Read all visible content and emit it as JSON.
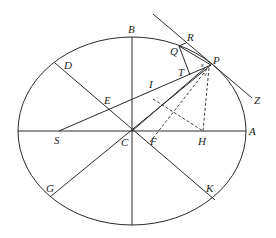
{
  "figure": {
    "type": "geometric-diagram",
    "colors": {
      "background": "#ffffff",
      "stroke": "#2a2a2a",
      "text": "#222222"
    },
    "ellipse": {
      "cx": 132,
      "cy": 131,
      "rx": 114,
      "ry": 94
    },
    "points": {
      "A": {
        "label": "A",
        "x": 246,
        "y": 131
      },
      "B": {
        "label": "B",
        "x": 132,
        "y": 37
      },
      "C": {
        "label": "C",
        "x": 132,
        "y": 131
      },
      "D": {
        "label": "D",
        "x": 55,
        "y": 63
      },
      "E": {
        "label": "E",
        "x": 108,
        "y": 108
      },
      "F": {
        "label": "F",
        "x": 151,
        "y": 143
      },
      "G": {
        "label": "G",
        "x": 52,
        "y": 197
      },
      "H": {
        "label": "H",
        "x": 203,
        "y": 131
      },
      "I": {
        "label": "I",
        "x": 151,
        "y": 96
      },
      "K": {
        "label": "K",
        "x": 209,
        "y": 198
      },
      "P": {
        "label": "P",
        "x": 211,
        "y": 65
      },
      "Q": {
        "label": "Q",
        "x": 180,
        "y": 45
      },
      "R": {
        "label": "R",
        "x": 186,
        "y": 40
      },
      "S": {
        "label": "S",
        "x": 59,
        "y": 131
      },
      "T": {
        "label": "T",
        "x": 189,
        "y": 73
      },
      "Z": {
        "label": "Z",
        "x": 252,
        "y": 97
      },
      "x": {
        "label": "x",
        "x": 204,
        "y": 67
      },
      "v": {
        "label": "v",
        "x": 207,
        "y": 73
      }
    }
  }
}
